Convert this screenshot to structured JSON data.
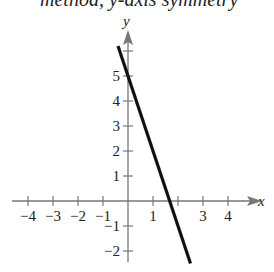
{
  "header_fragment": "method, y-axis symmetry",
  "chart_data": {
    "type": "line",
    "title": "",
    "xlabel": "x",
    "ylabel": "y",
    "xlim": [
      -4.5,
      5
    ],
    "ylim": [
      -2.7,
      6.7
    ],
    "x_ticks": [
      -4,
      -3,
      -2,
      -1,
      1,
      3,
      4
    ],
    "x_tick_labels": [
      "−4",
      "−3",
      "−2",
      "−1",
      "1",
      "3",
      "4"
    ],
    "y_ticks": [
      -2,
      -1,
      1,
      2,
      3,
      4,
      5
    ],
    "y_tick_labels": [
      "−2",
      "−1",
      "1",
      "2",
      "3",
      "4",
      "5"
    ],
    "grid": false,
    "series": [
      {
        "name": "y = -3x + 5",
        "x": [
          -0.4,
          2.5
        ],
        "y": [
          6.2,
          -2.5
        ],
        "color": "#111111"
      }
    ]
  }
}
